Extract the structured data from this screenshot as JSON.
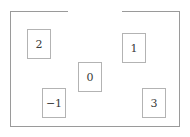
{
  "figure": {
    "background_color": "#ffffff",
    "frame": {
      "name": "outer-frame",
      "border_color": "#9a9a9a",
      "has_top_gap": true,
      "gap_start_x": 68,
      "gap_end_x": 122
    },
    "nodes": [
      {
        "label": "2",
        "x": 27,
        "y": 29,
        "w": 24,
        "h": 30,
        "border_color": "#b3b3b3",
        "text_color": "#3a3a3a"
      },
      {
        "label": "1",
        "x": 122,
        "y": 33,
        "w": 24,
        "h": 30,
        "border_color": "#b3b3b3",
        "text_color": "#3a3a3a"
      },
      {
        "label": "0",
        "x": 78,
        "y": 62,
        "w": 24,
        "h": 30,
        "border_color": "#b3b3b3",
        "text_color": "#3a3a3a"
      },
      {
        "label": "−1",
        "x": 42,
        "y": 88,
        "w": 24,
        "h": 30,
        "border_color": "#b3b3b3",
        "text_color": "#3a3a3a"
      },
      {
        "label": "3",
        "x": 142,
        "y": 88,
        "w": 24,
        "h": 30,
        "border_color": "#b3b3b3",
        "text_color": "#3a3a3a"
      }
    ]
  }
}
